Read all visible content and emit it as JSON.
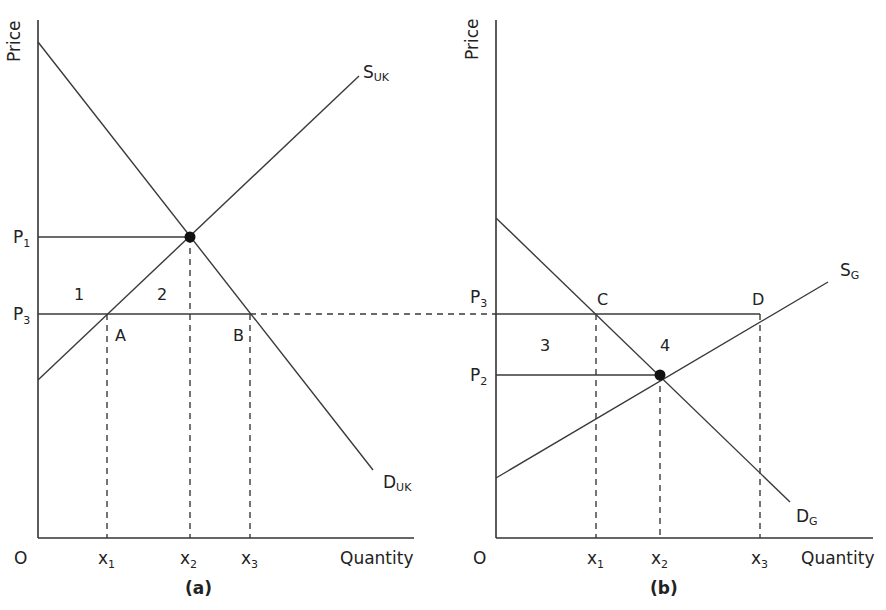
{
  "panel_a": {
    "caption": "(a)",
    "y_axis_label": "Price",
    "x_axis_label": "Quantity",
    "origin_label": "O",
    "supply_label": "S",
    "supply_sub": "UK",
    "demand_label": "D",
    "demand_sub": "UK",
    "price_labels": [
      {
        "main": "P",
        "sub": "1"
      },
      {
        "main": "P",
        "sub": "3"
      }
    ],
    "quantity_labels": [
      {
        "main": "x",
        "sub": "1"
      },
      {
        "main": "x",
        "sub": "2"
      },
      {
        "main": "x",
        "sub": "3"
      }
    ],
    "points": {
      "A": "A",
      "B": "B"
    },
    "areas": {
      "one": "1",
      "two": "2"
    }
  },
  "panel_b": {
    "caption": "(b)",
    "y_axis_label": "Price",
    "x_axis_label": "Quantity",
    "origin_label": "O",
    "supply_label": "S",
    "supply_sub": "G",
    "demand_label": "D",
    "demand_sub": "G",
    "price_labels": [
      {
        "main": "P",
        "sub": "3"
      },
      {
        "main": "P",
        "sub": "2"
      }
    ],
    "quantity_labels": [
      {
        "main": "x",
        "sub": "1"
      },
      {
        "main": "x",
        "sub": "2"
      },
      {
        "main": "x",
        "sub": "3"
      }
    ],
    "points": {
      "C": "C",
      "D": "D"
    },
    "areas": {
      "three": "3",
      "four": "4"
    }
  }
}
